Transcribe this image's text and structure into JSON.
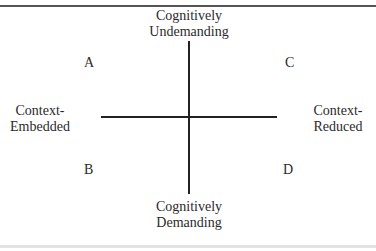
{
  "diagram": {
    "axes": {
      "top": {
        "line1": "Cognitively",
        "line2": "Undemanding"
      },
      "bottom": {
        "line1": "Cognitively",
        "line2": "Demanding"
      },
      "left": {
        "line1": "Context-",
        "line2": "Embedded"
      },
      "right": {
        "line1": "Context-",
        "line2": "Reduced"
      }
    },
    "quadrants": {
      "top_left": "A",
      "top_right": "C",
      "bottom_left": "B",
      "bottom_right": "D"
    }
  }
}
